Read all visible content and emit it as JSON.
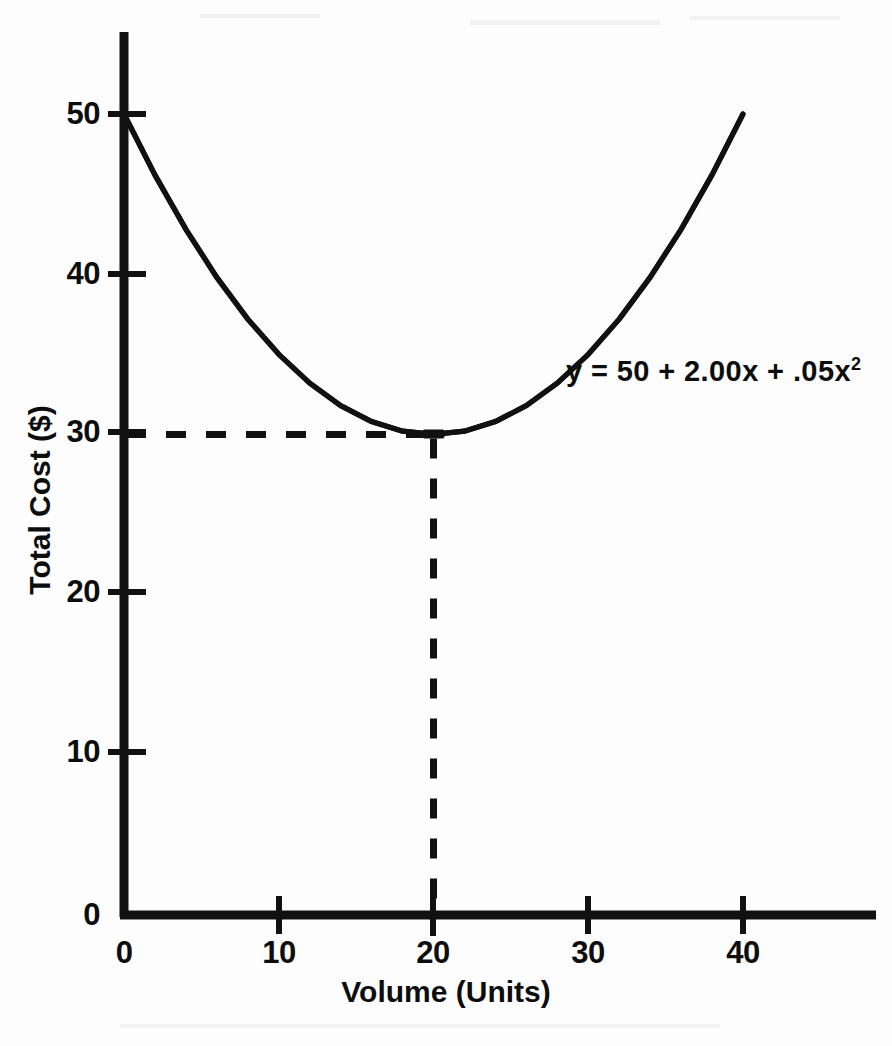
{
  "chart_data": {
    "type": "line",
    "title": "",
    "subtitle": "",
    "xlabel": "Volume (Units)",
    "ylabel": "Total Cost ($)",
    "xlim": [
      0,
      48
    ],
    "ylim": [
      0,
      55
    ],
    "grid": false,
    "legend": null,
    "x_ticks": [
      0,
      10,
      20,
      30,
      40
    ],
    "x_tick_labels": [
      "0",
      "10",
      "20",
      "30",
      "40"
    ],
    "y_ticks": [
      0,
      10,
      20,
      30,
      40,
      50
    ],
    "y_tick_labels": [
      "0",
      "10",
      "20",
      "30",
      "40",
      "50"
    ],
    "annotations": [
      {
        "name": "cost-equation",
        "text": "y = 50 + 2.00x + .05x²",
        "text_plain": "y = 50 + 2.00x + .05x2",
        "lead": "y  =  50  +  2.00x  +  .05x",
        "exponent": "2",
        "x": 26.5,
        "y": 33.5
      }
    ],
    "reference_lines": [
      {
        "name": "minimum-cost-horizontal",
        "orientation": "horizontal",
        "value": 30,
        "style": "dashed",
        "from_x": 0,
        "to_x": 20
      },
      {
        "name": "minimum-volume-vertical",
        "orientation": "vertical",
        "value": 20,
        "style": "dashed",
        "from_y": 0,
        "to_y": 30
      }
    ],
    "minimum_point": {
      "x": 20,
      "y": 30
    },
    "series": [
      {
        "name": "Total Cost",
        "color": "#111111",
        "x": [
          0,
          2,
          4,
          6,
          8,
          10,
          12,
          14,
          16,
          18,
          20,
          22,
          24,
          26,
          28,
          30,
          32,
          34,
          36,
          38,
          40
        ],
        "values": [
          50.0,
          46.2,
          42.8,
          39.8,
          37.2,
          35.0,
          33.2,
          31.8,
          30.8,
          30.2,
          30.0,
          30.2,
          30.8,
          31.8,
          33.2,
          35.0,
          37.2,
          39.8,
          42.8,
          46.2,
          50.0
        ]
      }
    ]
  },
  "axes": {
    "x_title": "Volume (Units)",
    "y_title": "Total Cost ($)"
  },
  "equation": {
    "lead": "y  =  50  +  2.00x  +  .05x",
    "exponent": "2"
  },
  "colors": {
    "ink": "#111111",
    "background": "#fdfdfd",
    "curve": "#111111",
    "dashed": "#111111"
  }
}
